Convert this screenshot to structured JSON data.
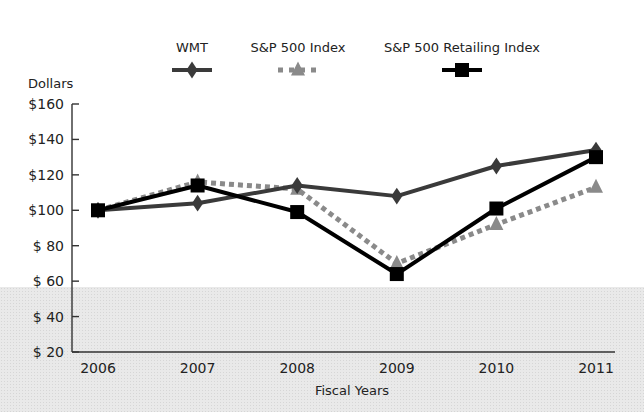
{
  "chart_data": {
    "type": "line",
    "title": "",
    "xlabel": "Fiscal Years",
    "ylabel": "Dollars",
    "categories": [
      "2006",
      "2007",
      "2008",
      "2009",
      "2010",
      "2011"
    ],
    "y_ticks": [
      "$160",
      "$140",
      "$120",
      "$100",
      "$ 80",
      "$ 60",
      "$ 40",
      "$ 20"
    ],
    "ylim": [
      20,
      160
    ],
    "grid": false,
    "legend_position": "top",
    "series": [
      {
        "name": "WMT",
        "marker": "diamond",
        "style": "solid",
        "color": "#3a3a3a",
        "values": [
          100,
          104,
          114,
          108,
          125,
          134
        ]
      },
      {
        "name": "S&P 500 Index",
        "marker": "triangle",
        "style": "dashed",
        "color": "#8a8a8a",
        "values": [
          100,
          116,
          112,
          70,
          92,
          113
        ]
      },
      {
        "name": "S&P 500 Retailing Index",
        "marker": "square",
        "style": "solid",
        "color": "#000000",
        "values": [
          100,
          114,
          99,
          64,
          101,
          130
        ]
      }
    ]
  }
}
